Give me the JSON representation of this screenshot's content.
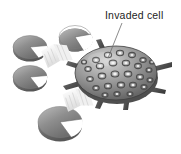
{
  "figure": {
    "background_color": "#ffffff",
    "label": {
      "text": "Invaded cell",
      "color": "#1d1d1d",
      "x": 105,
      "y": 19
    },
    "leader_line": {
      "color": "#6d6d6d",
      "from_x": 122,
      "from_y": 23,
      "to_x": 108,
      "to_y": 58
    }
  },
  "invaded_cell": {
    "name": "invaded cell",
    "center_x": 116,
    "center_y": 73,
    "radius_x": 41,
    "radius_y": 27,
    "body_color_light": "#d8d8d8",
    "body_color_mid": "#9a9a9a",
    "body_color_dark": "#5a5a5a",
    "outline_color": "#3a3a3a",
    "spot_count": 34,
    "spot_highlight_color": "#f2f2f2",
    "spot_ring_color": "#4e4e4e",
    "spike_count": 7,
    "spike_color": "#4a4a4a"
  },
  "uninvaded_cells": [
    {
      "id": "cell-top-right",
      "cx": 75,
      "cy": 37,
      "rx": 16,
      "ry": 12,
      "notch_angle": 20
    },
    {
      "id": "cell-upper-left",
      "cx": 30,
      "cy": 47,
      "rx": 17,
      "ry": 12,
      "notch_angle": 15
    },
    {
      "id": "cell-mid-left",
      "cx": 30,
      "cy": 77,
      "rx": 17,
      "ry": 12,
      "notch_angle": 15
    },
    {
      "id": "cell-bottom",
      "cx": 60,
      "cy": 122,
      "rx": 22,
      "ry": 16,
      "notch_angle": 18
    }
  ],
  "cell_style": {
    "fill_light": "#c8c8c8",
    "fill_dark": "#6f6f6f",
    "edge_color": "#8f8f8f",
    "rim_color": "#5c5c5c"
  },
  "motion_arrows": [
    {
      "id": "arrow-upper",
      "x": 44,
      "y": 46,
      "color": "#ececec"
    },
    {
      "id": "arrow-lower",
      "x": 65,
      "y": 90,
      "color": "#ececec"
    }
  ]
}
